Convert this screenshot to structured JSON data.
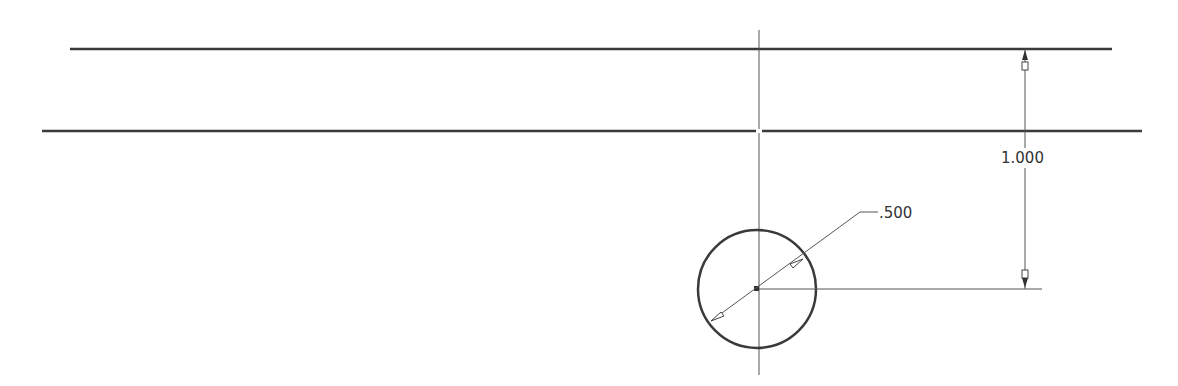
{
  "drawing": {
    "type": "CAD sketch",
    "colors": {
      "geometry": "#3a3a3a",
      "dimension": "#555555",
      "background": "#ffffff"
    },
    "lines": {
      "top_line": {
        "x1": 70,
        "y1": 49,
        "x2": 1112,
        "y2": 49
      },
      "second_line": {
        "x1": 42,
        "y1": 131,
        "x2": 1142,
        "y2": 131
      },
      "centerline_vertical": {
        "x1": 759,
        "y1": 30,
        "x2": 759,
        "y2": 375
      }
    },
    "circle": {
      "cx": 757,
      "cy": 289,
      "r": 59
    },
    "dimensions": {
      "linear": {
        "value": "1.000",
        "x": 1025,
        "y_top": 49,
        "y_bottom": 289,
        "text_x": 1000,
        "text_y": 163
      },
      "diameter": {
        "value": ".500",
        "text_x": 878,
        "text_y": 224
      }
    }
  }
}
